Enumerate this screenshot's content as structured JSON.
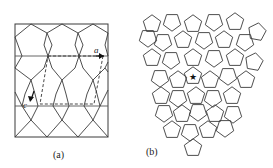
{
  "figure": {
    "panel_a": {
      "label": "(a)",
      "vector_labels": {
        "a": "a",
        "c": "c"
      },
      "frame": {
        "x": 15,
        "y": 24,
        "w": 93,
        "h": 113
      },
      "horizontal_lines_y": [
        56,
        106
      ]
    },
    "panel_b": {
      "label": "(b)",
      "center_marker": "★"
    },
    "colors": {
      "line": "#3a3a3a",
      "background": "#ffffff"
    }
  }
}
